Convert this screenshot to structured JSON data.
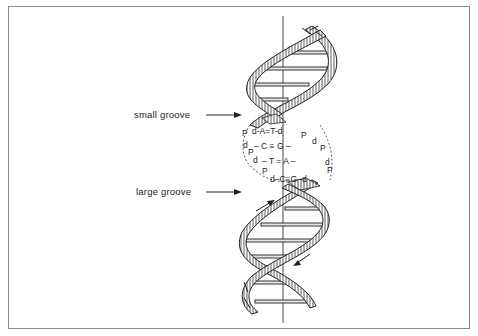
{
  "diagram": {
    "labels": {
      "small_groove": "small groove",
      "large_groove": "large groove"
    },
    "base_pairs": [
      {
        "left": "P",
        "row": "d-A=T-d",
        "right_1": "P"
      },
      {
        "left": "d",
        "row": "– C ≡ G –",
        "right_1": "d",
        "right_2": "P"
      },
      {
        "left": "P",
        "left_2": "d",
        "row": "– T = A –",
        "right_1": "d"
      },
      {
        "left": "P",
        "row": "d–C≡G–d",
        "right_1": "P"
      }
    ],
    "strand_glyphs": {
      "r1a": "d",
      "r1b": "P",
      "r2a": "d",
      "r2b": "P",
      "r3a": "d",
      "r4a": "P",
      "l1": "P",
      "l2": "d",
      "l3": "P",
      "l4": "d",
      "l5": "P"
    },
    "colors": {
      "ink": "#222222",
      "frame": "#8a8a8a",
      "background": "#ffffff"
    }
  }
}
